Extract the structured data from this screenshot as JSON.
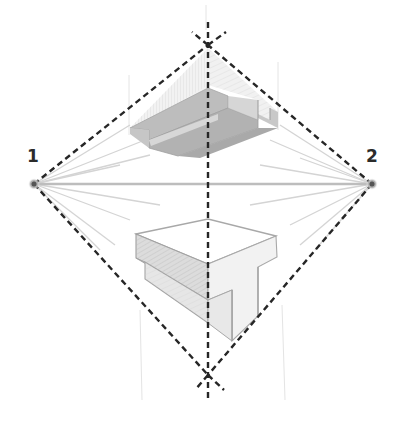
{
  "diagram": {
    "type": "two-point perspective construction",
    "colors": {
      "background": "#ffffff",
      "dashed_line": "#2a2a2a",
      "horizon": "#b9b9b9",
      "construction": "#d6d6d6",
      "vp_dot": "#9a9a9a",
      "shade_dark": "#a9a9a9",
      "shade_mid": "#c8c8c8",
      "shade_light": "#e2e2e2",
      "edge": "#9b9b9b",
      "label": "#2b2b2b"
    },
    "vanishing_points": [
      {
        "id": "vp1",
        "label": "1",
        "x": 34,
        "y": 184
      },
      {
        "id": "vp2",
        "label": "2",
        "x": 372,
        "y": 184
      }
    ],
    "top_vertex": {
      "x": 208,
      "y": 45
    },
    "bottom_vertex": {
      "x": 208,
      "y": 375
    },
    "vertical_axis": {
      "x": 208,
      "y1": 20,
      "y2": 395
    },
    "shapes": [
      {
        "id": "upper-shape",
        "description": "Stepped block seen from below (above horizon)"
      },
      {
        "id": "lower-shape",
        "description": "T-shaped block seen from above (below horizon)"
      }
    ]
  }
}
